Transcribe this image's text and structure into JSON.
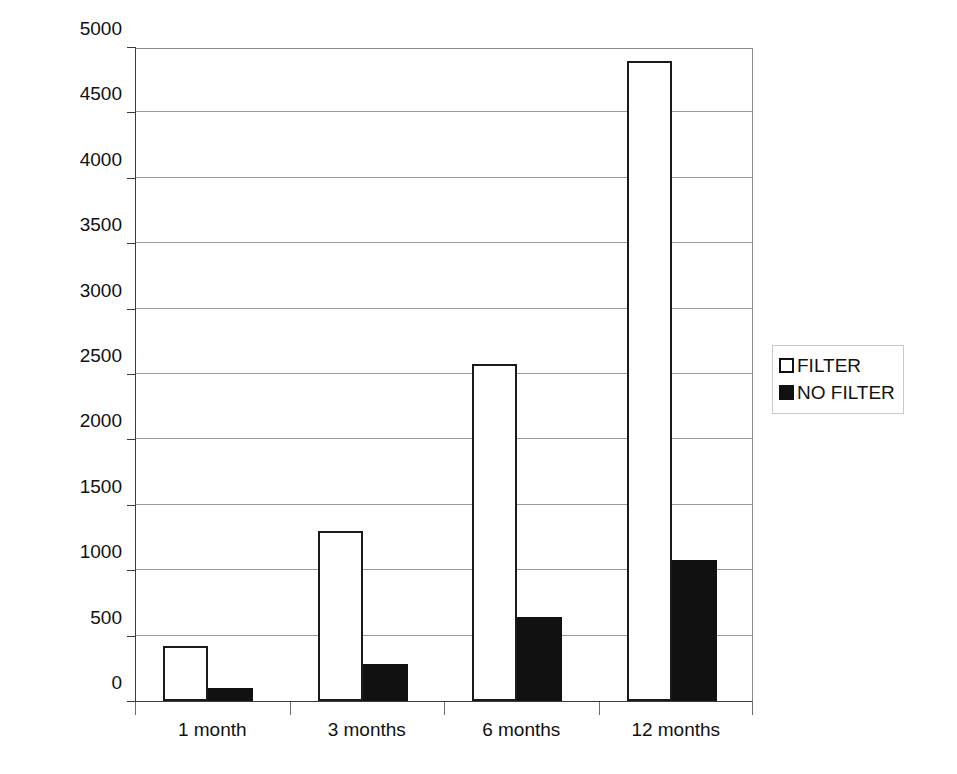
{
  "chart_data": {
    "type": "bar",
    "title": "",
    "subtitle": "",
    "xlabel": "",
    "ylabel": "Equity ($)",
    "categories": [
      "1 month",
      "3 months",
      "6 months",
      "12 months"
    ],
    "series": [
      {
        "name": "FILTER",
        "values": [
          420,
          1300,
          2580,
          4890
        ],
        "fill": "#ffffff",
        "stroke": "#111111"
      },
      {
        "name": "NO FILTER",
        "values": [
          100,
          285,
          640,
          1080
        ],
        "fill": "#111111",
        "stroke": "#111111"
      }
    ],
    "ylim": [
      0,
      5000
    ],
    "ytick_step": 500,
    "yticks": [
      0,
      500,
      1000,
      1500,
      2000,
      2500,
      3000,
      3500,
      4000,
      4500,
      5000
    ],
    "ytick_labels": [
      "0",
      "500",
      "1000",
      "1500",
      "2000",
      "2500",
      "3000",
      "3500",
      "4000",
      "4500",
      "5000"
    ],
    "grid": true,
    "grid_axis": "y",
    "legend_position": "right",
    "background": "#ffffff"
  },
  "legend": {
    "entries": [
      {
        "label": "FILTER",
        "swatch": "hollow-square"
      },
      {
        "label": "NO FILTER",
        "swatch": "filled-square"
      }
    ]
  }
}
